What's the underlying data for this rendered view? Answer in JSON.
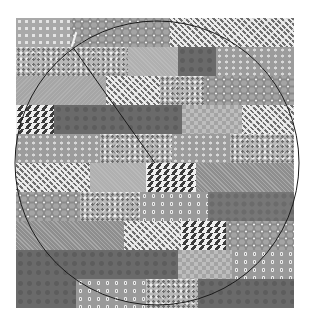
{
  "image": {
    "description": "Grayscale patchwork quilt of rectangular fabric blocks in 10 staggered rows, overlaid with a thin drawn circle and a radius line from a light needle at the top edge to the circle center.",
    "quilt": {
      "rows": [
        {
          "blocks": [
            {
              "pattern": "dots-light",
              "x": 0,
              "w": 54
            },
            {
              "pattern": "hex-dots",
              "x": 54,
              "w": 100
            },
            {
              "pattern": "weave",
              "x": 154,
              "w": 124
            }
          ]
        },
        {
          "blocks": [
            {
              "pattern": "floral",
              "x": 0,
              "w": 112
            },
            {
              "pattern": "light-solid",
              "x": 112,
              "w": 50
            },
            {
              "pattern": "dark",
              "x": 162,
              "w": 38
            },
            {
              "pattern": "dots-grey",
              "x": 200,
              "w": 78
            }
          ]
        },
        {
          "blocks": [
            {
              "pattern": "light-plain",
              "x": 0,
              "w": 90
            },
            {
              "pattern": "weave",
              "x": 90,
              "w": 54
            },
            {
              "pattern": "floral",
              "x": 144,
              "w": 44
            },
            {
              "pattern": "hex-dots",
              "x": 188,
              "w": 90
            }
          ]
        },
        {
          "blocks": [
            {
              "pattern": "diamonds",
              "x": 0,
              "w": 38
            },
            {
              "pattern": "dark",
              "x": 38,
              "w": 128
            },
            {
              "pattern": "light-check",
              "x": 166,
              "w": 60
            },
            {
              "pattern": "weave",
              "x": 226,
              "w": 52
            }
          ]
        },
        {
          "blocks": [
            {
              "pattern": "dots-grey",
              "x": 0,
              "w": 84
            },
            {
              "pattern": "floral",
              "x": 84,
              "w": 72
            },
            {
              "pattern": "dots-grey",
              "x": 156,
              "w": 58
            },
            {
              "pattern": "floral",
              "x": 214,
              "w": 64
            }
          ]
        },
        {
          "blocks": [
            {
              "pattern": "weave",
              "x": 0,
              "w": 74
            },
            {
              "pattern": "light-solid",
              "x": 74,
              "w": 56
            },
            {
              "pattern": "diamonds",
              "x": 130,
              "w": 50
            },
            {
              "pattern": "diag",
              "x": 180,
              "w": 98
            }
          ]
        },
        {
          "blocks": [
            {
              "pattern": "hex-dots",
              "x": 0,
              "w": 64
            },
            {
              "pattern": "floral",
              "x": 64,
              "w": 60
            },
            {
              "pattern": "dots-ring",
              "x": 124,
              "w": 68
            },
            {
              "pattern": "dark-mid",
              "x": 192,
              "w": 86
            }
          ]
        },
        {
          "blocks": [
            {
              "pattern": "diag",
              "x": 0,
              "w": 108
            },
            {
              "pattern": "weave",
              "x": 108,
              "w": 57
            },
            {
              "pattern": "diamonds",
              "x": 165,
              "w": 45
            },
            {
              "pattern": "hex-dots",
              "x": 210,
              "w": 68
            }
          ]
        },
        {
          "blocks": [
            {
              "pattern": "dark",
              "x": 0,
              "w": 162
            },
            {
              "pattern": "light-check",
              "x": 162,
              "w": 54
            },
            {
              "pattern": "dots-ring",
              "x": 216,
              "w": 62
            }
          ]
        },
        {
          "blocks": [
            {
              "pattern": "dark",
              "x": 0,
              "w": 60
            },
            {
              "pattern": "dots-ring",
              "x": 60,
              "w": 70
            },
            {
              "pattern": "floral",
              "x": 130,
              "w": 52
            },
            {
              "pattern": "dark",
              "x": 182,
              "w": 96
            }
          ]
        }
      ]
    },
    "overlay": {
      "circle": {
        "cx": 157,
        "cy": 163,
        "r": 142,
        "stroke": "#1a1a1a"
      },
      "radius_line": {
        "x1": 72,
        "y1": 46,
        "x2": 155,
        "y2": 163,
        "stroke": "#1a1a1a"
      },
      "needle": {
        "x1": 72,
        "y1": 46,
        "x2": 76,
        "y2": 33,
        "stroke": "#f2f2f2"
      }
    }
  }
}
